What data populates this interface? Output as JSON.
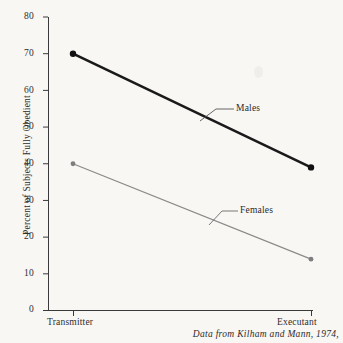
{
  "chart_data": {
    "type": "line",
    "title": "",
    "xlabel": "",
    "ylabel": "Percent of Subjects Fully Obedient",
    "categories": [
      "Transmitter",
      "Executant"
    ],
    "ylim": [
      0,
      80
    ],
    "yticks": [
      0,
      10,
      20,
      30,
      40,
      50,
      60,
      70,
      80
    ],
    "ytick_labels": [
      "0",
      "10",
      "20",
      "30",
      "40",
      "50",
      "60",
      "70",
      "80"
    ],
    "grid": false,
    "legend_position": "inline-annotations",
    "series": [
      {
        "name": "Males",
        "values": [
          70,
          39
        ],
        "color": "#1a1a1a",
        "line_width": 2.6,
        "marker": "circle"
      },
      {
        "name": "Females",
        "values": [
          40,
          14
        ],
        "color": "#8a8a8a",
        "line_width": 1.2,
        "marker": "circle"
      }
    ],
    "annotations": [
      {
        "text": "Males",
        "series": "Males"
      },
      {
        "text": "Females",
        "series": "Females"
      }
    ],
    "caption": "Data from Kilham and Mann, 1974,"
  },
  "axis": {
    "y_title": "Percent of Subjects Fully Obedient",
    "ytick_0": "0",
    "ytick_10": "10",
    "ytick_20": "20",
    "ytick_30": "30",
    "ytick_40": "40",
    "ytick_50": "50",
    "ytick_60": "60",
    "ytick_70": "70",
    "ytick_80": "80",
    "xtick_left": "Transmitter",
    "xtick_right": "Executant"
  },
  "labels": {
    "males": "Males",
    "females": "Females"
  },
  "caption": {
    "text": "Data from Kilham and Mann, 1974,"
  },
  "colors": {
    "males_line": "#1a1a1a",
    "females_line": "#8a8a8a",
    "axis": "#3a3a3a",
    "background": "#f8f7f4"
  }
}
